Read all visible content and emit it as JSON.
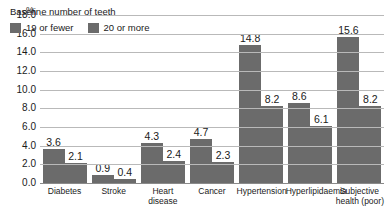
{
  "chart_data": {
    "type": "bar",
    "title": "",
    "xlabel": "",
    "ylabel": "%",
    "ylim": [
      0,
      18
    ],
    "ytick_step": 2,
    "yticks": [
      "18.0",
      "16.0",
      "14.0",
      "12.0",
      "10.0",
      "8.0",
      "6.0",
      "4.0",
      "2.0",
      "0.0"
    ],
    "grid": true,
    "legend_position": "inside-top-left",
    "legend_title": "Baseline number of teeth",
    "categories": [
      "Diabetes",
      "Stroke",
      "Heart disease",
      "Cancer",
      "Hypertension",
      "Hyperlipidaemia",
      "Subjective health (poor)"
    ],
    "category_lines": [
      [
        "Diabetes"
      ],
      [
        "Stroke"
      ],
      [
        "Heart disease"
      ],
      [
        "Cancer"
      ],
      [
        "Hypertension"
      ],
      [
        "Hyperlipidaemia"
      ],
      [
        "Subjective",
        "health (poor)"
      ]
    ],
    "series": [
      {
        "name": "19 or fewer",
        "color": "#6b6b6b",
        "values": [
          3.6,
          0.9,
          4.3,
          4.7,
          14.8,
          8.6,
          15.6
        ],
        "labels": [
          "3.6",
          "0.9",
          "4.3",
          "4.7",
          "14.8",
          "8.6",
          "15.6"
        ]
      },
      {
        "name": "20 or more",
        "color": "#6b6b6b",
        "values": [
          2.1,
          0.4,
          2.4,
          2.3,
          8.2,
          6.1,
          8.2
        ],
        "labels": [
          "2.1",
          "0.4",
          "2.4",
          "2.3",
          "8.2",
          "6.1",
          "8.2"
        ]
      }
    ]
  },
  "colors": {
    "bar": "#6b6b6b",
    "gridline": "#b9b9b9",
    "baseline": "#8a8a8a",
    "text": "#1a1a1a",
    "background": "#ffffff"
  }
}
